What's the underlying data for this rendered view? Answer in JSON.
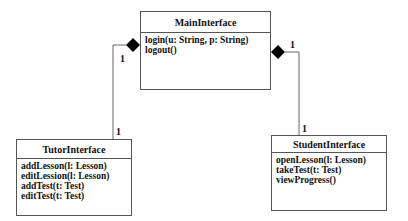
{
  "diagram": {
    "type": "UML class diagram",
    "classes": [
      {
        "id": "main",
        "name": "MainInterface",
        "operations": [
          "login(u: String, p: String)",
          "logout()"
        ]
      },
      {
        "id": "tutor",
        "name": "TutorInterface",
        "operations": [
          "addLesson(l: Lesson)",
          "editLession(l: Lesson)",
          "addTest(t: Test)",
          "editTest(t: Test)"
        ]
      },
      {
        "id": "student",
        "name": "StudentInterface",
        "operations": [
          "openLesson(l: Lesson)",
          "takeTest(t: Test)",
          "viewProgress()"
        ]
      }
    ],
    "relationships": [
      {
        "type": "composition",
        "whole": "MainInterface",
        "part": "TutorInterface",
        "whole_multiplicity": "1",
        "part_multiplicity": "1"
      },
      {
        "type": "composition",
        "whole": "MainInterface",
        "part": "StudentInterface",
        "whole_multiplicity": "1",
        "part_multiplicity": "1"
      }
    ]
  }
}
